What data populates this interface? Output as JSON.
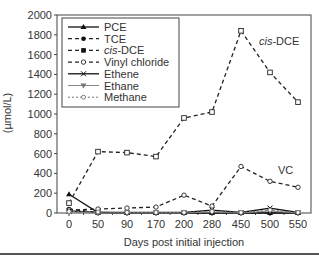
{
  "chart_data": {
    "type": "line",
    "title": "",
    "xlabel": "Days post initial injection",
    "ylabel": "(µmol/L)",
    "ylim": [
      0,
      2000
    ],
    "yticks": [
      0,
      200,
      400,
      600,
      800,
      1000,
      1200,
      1400,
      1600,
      1800,
      2000
    ],
    "categories": [
      "0",
      "50",
      "90",
      "170",
      "200",
      "280",
      "450",
      "500",
      "550"
    ],
    "grid": false,
    "legend_position": "upper-left",
    "series": [
      {
        "name": "PCE",
        "style": "solid",
        "marker": "filled-triangle",
        "values": [
          190,
          5,
          0,
          0,
          0,
          0,
          0,
          0,
          0
        ]
      },
      {
        "name": "TCE",
        "style": "dashed",
        "marker": "filled-circle",
        "values": [
          40,
          5,
          0,
          0,
          0,
          0,
          0,
          0,
          0
        ]
      },
      {
        "name": "cis-DCE",
        "name_italic_prefix": "cis",
        "style": "dashed",
        "marker": "square",
        "values": [
          100,
          620,
          610,
          570,
          960,
          1020,
          1840,
          1420,
          1120
        ]
      },
      {
        "name": "Vinyl chloride",
        "style": "dashed",
        "marker": "open-diamond",
        "values": [
          30,
          40,
          50,
          60,
          180,
          70,
          470,
          320,
          260
        ]
      },
      {
        "name": "Ethene",
        "style": "solid",
        "marker": "x",
        "values": [
          20,
          5,
          5,
          5,
          5,
          30,
          5,
          50,
          5
        ]
      },
      {
        "name": "Ethane",
        "style": "solid-gray",
        "marker": "filled-down-triangle",
        "values": [
          10,
          0,
          0,
          0,
          0,
          10,
          0,
          20,
          0
        ]
      },
      {
        "name": "Methane",
        "style": "dotted",
        "marker": "open-circle",
        "values": [
          15,
          10,
          5,
          5,
          5,
          15,
          5,
          30,
          5
        ]
      }
    ],
    "annotations": [
      {
        "text_italic": "cis",
        "text": "-DCE",
        "near": "cis-DCE peak at 450-500"
      },
      {
        "text": "VC",
        "near": "Vinyl chloride at 500"
      }
    ]
  },
  "legend": {
    "items": [
      "PCE",
      "TCE",
      "-DCE",
      "Vinyl chloride",
      "Ethene",
      "Ethane",
      "Methane"
    ],
    "italic_prefix": "cis"
  },
  "annotations": {
    "cisdce_italic": "cis",
    "cisdce_rest": "-DCE",
    "vc": "VC"
  },
  "axes": {
    "ylabel": "(µmol/L)",
    "xlabel": "Days post initial injection",
    "yticks": [
      "0",
      "200",
      "400",
      "600",
      "800",
      "1000",
      "1200",
      "1400",
      "1600",
      "1800",
      "2000"
    ],
    "xticks": [
      "0",
      "50",
      "90",
      "170",
      "200",
      "280",
      "450",
      "500",
      "550"
    ]
  }
}
